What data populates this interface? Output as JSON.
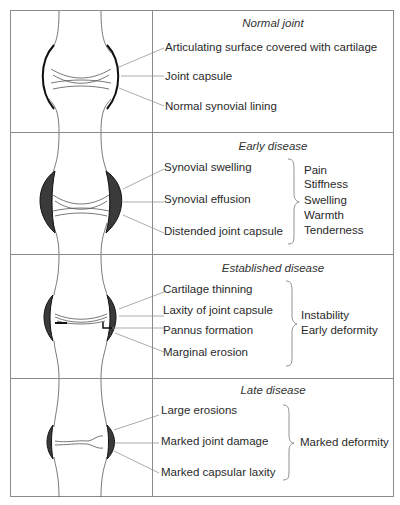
{
  "panels": [
    {
      "title": "Normal joint",
      "labels": [
        "Articulating surface covered with  cartilage",
        "Joint capsule",
        "Normal synovial lining"
      ],
      "symptoms": []
    },
    {
      "title": "Early disease",
      "labels": [
        "Synovial swelling",
        "Synovial effusion",
        "Distended joint  capsule"
      ],
      "symptoms": [
        "Pain",
        "Stiffness",
        "Swelling",
        "Warmth",
        "Tenderness"
      ]
    },
    {
      "title": "Established disease",
      "labels": [
        "Cartilage thinning",
        "Laxity of joint capsule",
        "Pannus formation",
        "Marginal erosion"
      ],
      "symptoms": [
        "Instability",
        "Early deformity"
      ]
    },
    {
      "title": "Late disease",
      "labels": [
        "Large erosions",
        "Marked joint damage",
        "Marked capsular laxity"
      ],
      "symptoms": [
        "Marked deformity"
      ]
    }
  ],
  "icons": {
    "joint_normal": "normal-joint-illustration",
    "joint_early": "early-disease-joint-illustration",
    "joint_established": "established-disease-joint-illustration",
    "joint_late": "late-disease-joint-illustration",
    "bracket": "curly-brace"
  }
}
